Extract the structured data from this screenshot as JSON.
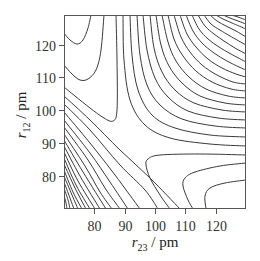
{
  "chart_data": {
    "type": "contour",
    "title": "",
    "xlabel": "r23 / pm",
    "ylabel": "r12 / pm",
    "xlabel_parts": {
      "symbol": "r",
      "subscript": "23",
      "unit": " / pm"
    },
    "ylabel_parts": {
      "symbol": "r",
      "subscript": "12",
      "unit": " / pm"
    },
    "xlim": [
      70,
      130
    ],
    "ylim": [
      70,
      129
    ],
    "xticks": [
      80,
      90,
      100,
      110,
      120
    ],
    "yticks": [
      80,
      90,
      100,
      110,
      120
    ],
    "grid": false,
    "legend": null,
    "frame_px": {
      "left": 64,
      "top": 15,
      "right": 246,
      "bottom": 209
    },
    "contours_px": [
      {
        "group": "product-valley",
        "points": [
          [
            64,
            33
          ],
          [
            70,
            40
          ],
          [
            77,
            44
          ],
          [
            83,
            40
          ],
          [
            88,
            28
          ],
          [
            91,
            15
          ]
        ]
      },
      {
        "group": "product-valley",
        "points": [
          [
            64,
            65
          ],
          [
            72,
            74
          ],
          [
            80,
            80
          ],
          [
            88,
            79
          ],
          [
            96,
            70
          ],
          [
            101,
            50
          ],
          [
            104,
            15
          ]
        ]
      },
      {
        "group": "product-valley",
        "points": [
          [
            64,
            87
          ],
          [
            75,
            96
          ],
          [
            90,
            108
          ],
          [
            104,
            118
          ],
          [
            113,
            121
          ],
          [
            117,
            110
          ],
          [
            117,
            60
          ],
          [
            116,
            15
          ]
        ]
      },
      {
        "group": "reactant-valley",
        "points": [
          [
            246,
            155
          ],
          [
            200,
            154
          ],
          [
            160,
            155
          ],
          [
            148,
            159
          ],
          [
            146,
            165
          ],
          [
            150,
            178
          ],
          [
            160,
            195
          ],
          [
            170,
            209
          ]
        ]
      },
      {
        "group": "reactant-valley",
        "points": [
          [
            246,
            163
          ],
          [
            220,
            166
          ],
          [
            195,
            172
          ],
          [
            185,
            178
          ],
          [
            183,
            186
          ],
          [
            188,
            200
          ],
          [
            193,
            209
          ]
        ]
      },
      {
        "group": "reactant-valley",
        "points": [
          [
            246,
            180
          ],
          [
            225,
            183
          ],
          [
            210,
            188
          ],
          [
            205,
            196
          ],
          [
            206,
            209
          ]
        ]
      },
      {
        "group": "repulsive",
        "points": [
          [
            64,
            96
          ],
          [
            90,
            120
          ],
          [
            120,
            150
          ],
          [
            150,
            178
          ],
          [
            180,
            209
          ]
        ]
      },
      {
        "group": "repulsive",
        "points": [
          [
            64,
            104
          ],
          [
            90,
            130
          ],
          [
            120,
            165
          ],
          [
            145,
            190
          ],
          [
            158,
            209
          ]
        ]
      },
      {
        "group": "repulsive",
        "points": [
          [
            64,
            112
          ],
          [
            90,
            143
          ],
          [
            115,
            175
          ],
          [
            140,
            209
          ]
        ]
      },
      {
        "group": "repulsive",
        "points": [
          [
            64,
            120
          ],
          [
            90,
            153
          ],
          [
            110,
            182
          ],
          [
            128,
            209
          ]
        ]
      },
      {
        "group": "repulsive",
        "points": [
          [
            64,
            127
          ],
          [
            88,
            160
          ],
          [
            105,
            188
          ],
          [
            120,
            209
          ]
        ]
      },
      {
        "group": "repulsive",
        "points": [
          [
            64,
            134
          ],
          [
            85,
            166
          ],
          [
            100,
            192
          ],
          [
            112,
            209
          ]
        ]
      },
      {
        "group": "repulsive",
        "points": [
          [
            64,
            140
          ],
          [
            83,
            172
          ],
          [
            106,
            209
          ]
        ]
      },
      {
        "group": "repulsive",
        "points": [
          [
            64,
            146
          ],
          [
            80,
            176
          ],
          [
            100,
            209
          ]
        ]
      },
      {
        "group": "repulsive",
        "points": [
          [
            64,
            152
          ],
          [
            78,
            181
          ],
          [
            95,
            209
          ]
        ]
      },
      {
        "group": "repulsive",
        "points": [
          [
            64,
            158
          ],
          [
            76,
            185
          ],
          [
            90,
            209
          ]
        ]
      },
      {
        "group": "repulsive",
        "points": [
          [
            64,
            164
          ],
          [
            75,
            188
          ],
          [
            86,
            209
          ]
        ]
      },
      {
        "group": "repulsive",
        "points": [
          [
            64,
            170
          ],
          [
            73,
            192
          ],
          [
            82,
            209
          ]
        ]
      },
      {
        "group": "repulsive",
        "points": [
          [
            64,
            176
          ],
          [
            72,
            195
          ],
          [
            78,
            209
          ]
        ]
      },
      {
        "group": "repulsive",
        "points": [
          [
            64,
            182
          ],
          [
            70,
            198
          ],
          [
            74,
            209
          ]
        ]
      },
      {
        "group": "repulsive",
        "points": [
          [
            64,
            188
          ],
          [
            68,
            200
          ],
          [
            70,
            209
          ]
        ]
      },
      {
        "group": "repulsive",
        "points": [
          [
            64,
            195
          ],
          [
            66,
            203
          ],
          [
            67,
            209
          ]
        ]
      },
      {
        "group": "plateau",
        "points": [
          [
            123,
            15
          ],
          [
            124,
            60
          ],
          [
            130,
            100
          ],
          [
            145,
            125
          ],
          [
            170,
            138
          ],
          [
            210,
            144
          ],
          [
            246,
            146
          ]
        ]
      },
      {
        "group": "plateau",
        "points": [
          [
            130,
            15
          ],
          [
            132,
            55
          ],
          [
            138,
            90
          ],
          [
            152,
            115
          ],
          [
            175,
            128
          ],
          [
            210,
            135
          ],
          [
            246,
            137
          ]
        ]
      },
      {
        "group": "plateau",
        "points": [
          [
            137,
            15
          ],
          [
            140,
            55
          ],
          [
            147,
            85
          ],
          [
            160,
            105
          ],
          [
            182,
            119
          ],
          [
            215,
            126
          ],
          [
            246,
            128
          ]
        ]
      },
      {
        "group": "plateau",
        "points": [
          [
            143,
            15
          ],
          [
            147,
            50
          ],
          [
            155,
            78
          ],
          [
            168,
            97
          ],
          [
            188,
            111
          ],
          [
            218,
            118
          ],
          [
            246,
            120
          ]
        ]
      },
      {
        "group": "plateau",
        "points": [
          [
            150,
            15
          ],
          [
            154,
            48
          ],
          [
            162,
            72
          ],
          [
            175,
            90
          ],
          [
            194,
            103
          ],
          [
            222,
            110
          ],
          [
            246,
            112
          ]
        ]
      },
      {
        "group": "plateau",
        "points": [
          [
            156,
            15
          ],
          [
            161,
            45
          ],
          [
            169,
            66
          ],
          [
            182,
            83
          ],
          [
            200,
            96
          ],
          [
            225,
            103
          ],
          [
            246,
            105
          ]
        ]
      },
      {
        "group": "plateau",
        "points": [
          [
            162,
            15
          ],
          [
            168,
            42
          ],
          [
            176,
            61
          ],
          [
            189,
            77
          ],
          [
            206,
            89
          ],
          [
            228,
            96
          ],
          [
            246,
            98
          ]
        ]
      },
      {
        "group": "plateau",
        "points": [
          [
            168,
            15
          ],
          [
            174,
            39
          ],
          [
            183,
            56
          ],
          [
            196,
            71
          ],
          [
            212,
            82
          ],
          [
            231,
            89
          ],
          [
            246,
            91
          ]
        ]
      },
      {
        "group": "plateau",
        "points": [
          [
            174,
            15
          ],
          [
            181,
            37
          ],
          [
            190,
            52
          ],
          [
            202,
            65
          ],
          [
            217,
            75
          ],
          [
            233,
            82
          ],
          [
            246,
            84
          ]
        ]
      },
      {
        "group": "plateau",
        "points": [
          [
            180,
            15
          ],
          [
            187,
            34
          ],
          [
            196,
            47
          ],
          [
            208,
            59
          ],
          [
            222,
            68
          ],
          [
            236,
            74
          ],
          [
            246,
            77
          ]
        ]
      },
      {
        "group": "plateau",
        "points": [
          [
            186,
            15
          ],
          [
            193,
            31
          ],
          [
            202,
            43
          ],
          [
            214,
            53
          ],
          [
            227,
            61
          ],
          [
            239,
            67
          ],
          [
            246,
            70
          ]
        ]
      },
      {
        "group": "plateau",
        "points": [
          [
            192,
            15
          ],
          [
            199,
            29
          ],
          [
            208,
            39
          ],
          [
            219,
            47
          ],
          [
            231,
            54
          ],
          [
            246,
            62
          ]
        ]
      },
      {
        "group": "plateau",
        "points": [
          [
            198,
            15
          ],
          [
            205,
            26
          ],
          [
            214,
            34
          ],
          [
            224,
            41
          ],
          [
            235,
            48
          ],
          [
            246,
            54
          ]
        ]
      },
      {
        "group": "plateau",
        "points": [
          [
            204,
            15
          ],
          [
            211,
            24
          ],
          [
            220,
            30
          ],
          [
            230,
            36
          ],
          [
            246,
            45
          ]
        ]
      },
      {
        "group": "plateau",
        "points": [
          [
            210,
            15
          ],
          [
            217,
            21
          ],
          [
            226,
            26
          ],
          [
            236,
            31
          ],
          [
            246,
            37
          ]
        ]
      },
      {
        "group": "plateau",
        "points": [
          [
            216,
            15
          ],
          [
            223,
            19
          ],
          [
            232,
            23
          ],
          [
            246,
            29
          ]
        ]
      },
      {
        "group": "plateau",
        "points": [
          [
            223,
            15
          ],
          [
            230,
            18
          ],
          [
            238,
            21
          ],
          [
            246,
            24
          ]
        ]
      },
      {
        "group": "plateau",
        "points": [
          [
            231,
            15
          ],
          [
            238,
            17
          ],
          [
            246,
            20
          ]
        ]
      }
    ]
  }
}
